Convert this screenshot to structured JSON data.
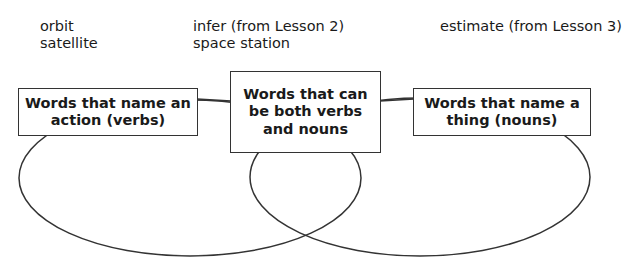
{
  "word_bank": {
    "column1": [
      "orbit",
      "satellite"
    ],
    "column2": [
      "infer (from Lesson 2)",
      "space station"
    ],
    "column3": [
      "estimate (from Lesson 3)"
    ]
  },
  "diagram": {
    "type": "venn",
    "left_label": "Words that name an action (verbs)",
    "center_label": "Words that can be both verbs and nouns",
    "right_label": "Words that name a thing (nouns)",
    "line_color": "#333333"
  }
}
